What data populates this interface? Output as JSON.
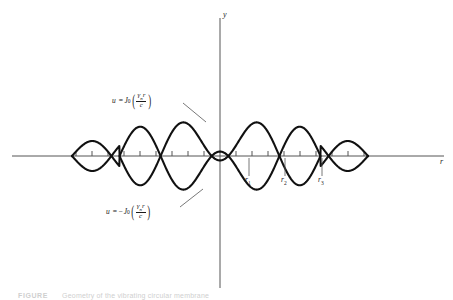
{
  "figure": {
    "background_color": "#ffffff",
    "curve_color": "#111111",
    "axis_color": "#555555"
  },
  "axes": {
    "x_axis_label": "r",
    "y_axis_label": "y",
    "x_axis_y_px": 156,
    "y_axis_x_px": 220,
    "x_axis_start_px": 12,
    "x_axis_end_px": 444,
    "y_axis_top_px": 18,
    "y_axis_bottom_px": 288,
    "tick_count": 22,
    "tick_spacing_px": 16,
    "tick_length_px": 5
  },
  "annotations": {
    "positive_curve": {
      "lhs": "u",
      "equals": "=",
      "negate": "",
      "symbol": "J",
      "subscript": "0",
      "numerator": "γ",
      "numerator_sub": "n",
      "numerator_tail": "r",
      "denominator": "c",
      "full_text": "u = J0(γn r / c)"
    },
    "negative_curve": {
      "lhs": "u",
      "equals": "=",
      "negate": "−",
      "symbol": "J",
      "subscript": "0",
      "numerator": "γ",
      "numerator_sub": "n",
      "numerator_tail": "r",
      "denominator": "c",
      "full_text": "u = −J0(γn r / c)"
    },
    "leaders": [
      {
        "name": "leader-positive",
        "x1": 183,
        "y1": 103,
        "x2": 206,
        "y2": 122
      },
      {
        "name": "leader-negative",
        "x1": 180,
        "y1": 207,
        "x2": 203,
        "y2": 189
      }
    ]
  },
  "nodes": [
    {
      "label": "r",
      "sub": "1",
      "x_px": 249,
      "leader_y1": 158,
      "leader_y2": 176
    },
    {
      "label": "r",
      "sub": "2",
      "x_px": 285,
      "leader_y1": 158,
      "leader_y2": 176
    },
    {
      "label": "r",
      "sub": "3",
      "x_px": 322,
      "leader_y1": 158,
      "leader_y2": 176
    }
  ],
  "caption": {
    "tag": "FIGURE",
    "text": "Geometry of the vibrating circular membrane"
  },
  "chart_data": {
    "type": "line",
    "xlabel": "r",
    "ylabel": "y",
    "grid": false,
    "legend": "none",
    "x_center_px": 220,
    "x_amplitude_scale_px": 60,
    "bessel_order": 0,
    "x_domain_units": [
      -11.8,
      11.8
    ],
    "px_per_unit": 12.55,
    "zeros_units": [
      2.4048,
      5.5201,
      8.6537,
      11.7915
    ],
    "zeros_px": [
      249.2,
      289.3,
      328.6,
      368.0
    ],
    "extrema_units": [
      0.0,
      3.8317,
      7.0156,
      10.1735
    ],
    "extrema_values": [
      1.0,
      -0.4028,
      0.3001,
      -0.2497
    ],
    "series": [
      {
        "name": "u = J0(γn r / c)",
        "color": "#111111",
        "style": "solid"
      },
      {
        "name": "u = -J0(γn r / c)",
        "color": "#111111",
        "style": "solid"
      }
    ],
    "sampled_x_units": [
      -11.79,
      -10.17,
      -8.65,
      -7.02,
      -5.52,
      -3.83,
      -2.4,
      0.0,
      2.4,
      3.83,
      5.52,
      7.02,
      8.65,
      10.17,
      11.79
    ],
    "sampled_j0": [
      0.0,
      -0.2497,
      0.0,
      0.3001,
      0.0,
      -0.4028,
      0.0,
      1.0,
      0.0,
      -0.4028,
      0.0,
      0.3001,
      0.0,
      -0.2497,
      0.0
    ]
  }
}
